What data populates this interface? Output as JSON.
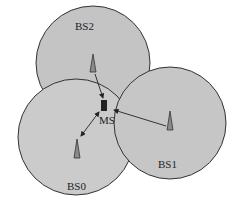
{
  "diagram": {
    "type": "cellular-network",
    "cells": [
      {
        "id": "BS0",
        "label": "BS0",
        "cx": 76,
        "cy": 137,
        "r": 58
      },
      {
        "id": "BS1",
        "label": "BS1",
        "cx": 170,
        "cy": 123,
        "r": 56
      },
      {
        "id": "BS2",
        "label": "BS2",
        "cx": 93,
        "cy": 63,
        "r": 57
      }
    ],
    "mobile_station": {
      "label": "MS",
      "x": 103,
      "y": 100
    },
    "links": [
      {
        "from": "BS2",
        "to": "MS",
        "direction": "to-MS"
      },
      {
        "from": "BS1",
        "to": "MS",
        "direction": "to-MS"
      },
      {
        "from": "BS0",
        "to": "MS",
        "direction": "bidirectional"
      }
    ],
    "colors": {
      "cell_fill": "#c8c8c8",
      "cell_stroke": "#333333",
      "tower_fill": "#8a8a8a",
      "ms_fill": "#222222"
    }
  }
}
